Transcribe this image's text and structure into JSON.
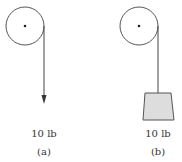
{
  "diagram": {
    "type": "pulley-comparison",
    "colors": {
      "line": "#444444",
      "weight_fill": "#dddddd",
      "text": "#333333",
      "background": "#ffffff"
    },
    "panels": [
      {
        "id": "a",
        "pulley": {
          "cx": 25,
          "cy": 26,
          "r": 19
        },
        "rope": {
          "x": 44,
          "y1": 26,
          "y2": 103
        },
        "load": "force-arrow",
        "force_label": "10 lb",
        "caption": "(a)"
      },
      {
        "id": "b",
        "pulley": {
          "cx": 139,
          "cy": 26,
          "r": 19
        },
        "rope": {
          "x": 158,
          "y1": 26,
          "y2": 93
        },
        "load": "hanging-weight",
        "force_label": "10 lb",
        "caption": "(b)"
      }
    ]
  }
}
